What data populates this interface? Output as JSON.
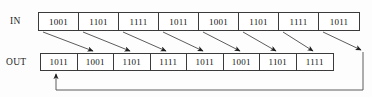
{
  "figure": {
    "background_color": "#fdfdfd",
    "line_color": "#3b3b3b",
    "text_color": "#141414"
  },
  "rows": {
    "input": {
      "label": "IN",
      "cells": [
        "1001",
        "1101",
        "1111",
        "1011",
        "1001",
        "1101",
        "1111",
        "1011"
      ]
    },
    "output": {
      "label": "OUT",
      "cells": [
        "1011",
        "1001",
        "1101",
        "1111",
        "1011",
        "1001",
        "1101",
        "1111"
      ]
    }
  },
  "connections": {
    "diagonal_arrows": [
      {
        "from_cell": 0,
        "to_cell": 1
      },
      {
        "from_cell": 1,
        "to_cell": 2
      },
      {
        "from_cell": 2,
        "to_cell": 3
      },
      {
        "from_cell": 3,
        "to_cell": 4
      },
      {
        "from_cell": 4,
        "to_cell": 5
      },
      {
        "from_cell": 5,
        "to_cell": 6
      },
      {
        "from_cell": 6,
        "to_cell": 7
      }
    ],
    "wraparound": {
      "from_cell": 7,
      "to_cell": 0
    }
  }
}
